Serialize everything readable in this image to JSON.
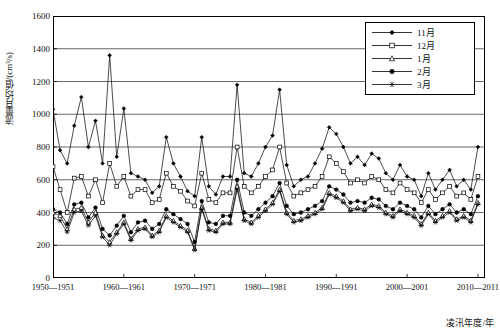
{
  "chart_data": {
    "type": "line",
    "title": "",
    "xlabel": "凌汛年度/年",
    "ylabel": "流量月均值/(cm³/s)",
    "ylim": [
      0,
      1600
    ],
    "yticks": [
      0,
      200,
      400,
      600,
      800,
      1000,
      1200,
      1400,
      1600
    ],
    "xlim": [
      1950,
      2011
    ],
    "xticks": [
      "1950—1951",
      "1960—1961",
      "1970—1971",
      "1980—1981",
      "1990—1991",
      "2000—2001",
      "2010—2011"
    ],
    "xtick_values": [
      1950,
      1960,
      1970,
      1980,
      1990,
      2000,
      2010
    ],
    "grid": true,
    "legend_position": "top-right",
    "x": [
      1950,
      1951,
      1952,
      1953,
      1954,
      1955,
      1956,
      1957,
      1958,
      1959,
      1960,
      1961,
      1962,
      1963,
      1964,
      1965,
      1966,
      1967,
      1968,
      1969,
      1970,
      1971,
      1972,
      1973,
      1974,
      1975,
      1976,
      1977,
      1978,
      1979,
      1980,
      1981,
      1982,
      1983,
      1984,
      1985,
      1986,
      1987,
      1988,
      1989,
      1990,
      1991,
      1992,
      1993,
      1994,
      1995,
      1996,
      1997,
      1998,
      1999,
      2000,
      2001,
      2002,
      2003,
      2004,
      2005,
      2006,
      2007,
      2008,
      2009,
      2010
    ],
    "series": [
      {
        "name": "11月",
        "marker": "filled-diamond",
        "values": [
          1030,
          780,
          700,
          930,
          1105,
          800,
          960,
          700,
          1360,
          740,
          1035,
          640,
          620,
          600,
          520,
          560,
          860,
          700,
          620,
          530,
          500,
          860,
          560,
          510,
          620,
          620,
          1180,
          640,
          620,
          700,
          800,
          870,
          1150,
          690,
          560,
          600,
          620,
          700,
          790,
          920,
          880,
          800,
          700,
          740,
          690,
          760,
          730,
          640,
          600,
          690,
          620,
          600,
          500,
          640,
          540,
          600,
          660,
          560,
          600,
          540,
          800
        ]
      },
      {
        "name": "12月",
        "marker": "open-square",
        "values": [
          680,
          540,
          400,
          610,
          620,
          500,
          600,
          460,
          700,
          560,
          620,
          500,
          540,
          540,
          460,
          480,
          640,
          560,
          530,
          470,
          440,
          640,
          480,
          460,
          520,
          520,
          800,
          560,
          520,
          560,
          620,
          660,
          800,
          580,
          500,
          520,
          540,
          560,
          620,
          740,
          700,
          650,
          580,
          600,
          580,
          620,
          600,
          540,
          520,
          580,
          540,
          520,
          460,
          540,
          480,
          520,
          560,
          500,
          520,
          480,
          620
        ]
      },
      {
        "name": "1月",
        "marker": "open-triangle",
        "values": [
          400,
          380,
          300,
          420,
          430,
          340,
          400,
          260,
          220,
          280,
          340,
          240,
          300,
          310,
          260,
          290,
          380,
          350,
          320,
          290,
          180,
          430,
          300,
          290,
          340,
          340,
          560,
          360,
          340,
          380,
          420,
          460,
          540,
          400,
          350,
          360,
          380,
          400,
          430,
          520,
          500,
          470,
          420,
          430,
          420,
          450,
          440,
          400,
          380,
          420,
          400,
          380,
          330,
          400,
          350,
          380,
          410,
          360,
          380,
          350,
          460
        ]
      },
      {
        "name": "2月",
        "marker": "filled-circle",
        "values": [
          420,
          400,
          330,
          450,
          460,
          370,
          430,
          300,
          260,
          320,
          380,
          280,
          340,
          350,
          300,
          330,
          420,
          390,
          360,
          330,
          220,
          470,
          340,
          330,
          380,
          380,
          600,
          400,
          380,
          420,
          460,
          500,
          580,
          440,
          390,
          400,
          420,
          440,
          470,
          560,
          540,
          510,
          460,
          470,
          460,
          490,
          480,
          440,
          420,
          460,
          440,
          420,
          370,
          440,
          390,
          420,
          450,
          400,
          420,
          390,
          500
        ]
      },
      {
        "name": "3月",
        "marker": "star",
        "values": [
          370,
          350,
          280,
          400,
          410,
          320,
          380,
          250,
          200,
          270,
          330,
          230,
          290,
          300,
          250,
          280,
          370,
          340,
          310,
          280,
          170,
          420,
          290,
          280,
          330,
          330,
          540,
          350,
          330,
          370,
          410,
          450,
          530,
          390,
          340,
          350,
          370,
          390,
          420,
          510,
          490,
          460,
          410,
          420,
          410,
          440,
          430,
          390,
          370,
          410,
          390,
          370,
          320,
          390,
          340,
          370,
          400,
          350,
          370,
          340,
          450
        ]
      }
    ]
  },
  "legend": {
    "items": [
      {
        "label": "11月"
      },
      {
        "label": "12月"
      },
      {
        "label": "1月"
      },
      {
        "label": "2月"
      },
      {
        "label": "3月"
      }
    ]
  }
}
